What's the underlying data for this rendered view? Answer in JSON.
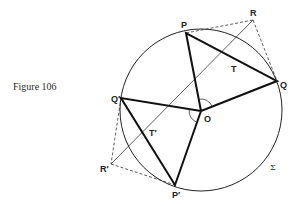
{
  "figure": {
    "caption": "Figure 106",
    "labels": {
      "P": "P",
      "Q": "Q",
      "R": "R",
      "T": "T",
      "O": "O",
      "P_prime": "P′",
      "Q_prime": "Q′",
      "R_prime": "R′",
      "T_prime": "T′",
      "Sigma": "Σ"
    },
    "colors": {
      "stroke": "#222222",
      "background": "#ffffff"
    }
  }
}
